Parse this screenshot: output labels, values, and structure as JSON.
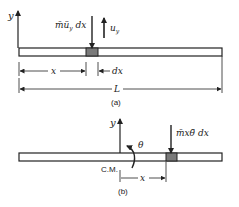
{
  "figure_a": {
    "y_axis_label": "y",
    "inertia_force_label": "m̄ü",
    "inertia_force_sub": "y",
    "inertia_force_suffix": " dx",
    "displacement_label": "u",
    "displacement_sub": "y",
    "x_dim_label": "x",
    "dx_dim_label": "dx",
    "length_label": "L",
    "caption": "(a)"
  },
  "figure_b": {
    "y_axis_label": "y",
    "theta_label": "θ",
    "inertia_force_label": "m̄xθ̈ dx",
    "cm_label": "C.M.",
    "x_dim_label": "x",
    "caption": "(b)"
  },
  "colors": {
    "line": "#222222",
    "element_fill": "#7a7a7a",
    "beam_fill": "#ffffff"
  }
}
